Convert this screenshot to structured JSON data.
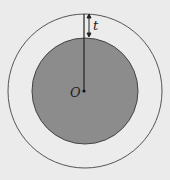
{
  "diagram": {
    "center_label": "O",
    "thickness_label": "t",
    "colors": {
      "background": "#ebebeb",
      "outer_stroke": "#555555",
      "inner_fill": "#8c8c8c",
      "inner_stroke": "#444444",
      "line": "#222222"
    }
  }
}
